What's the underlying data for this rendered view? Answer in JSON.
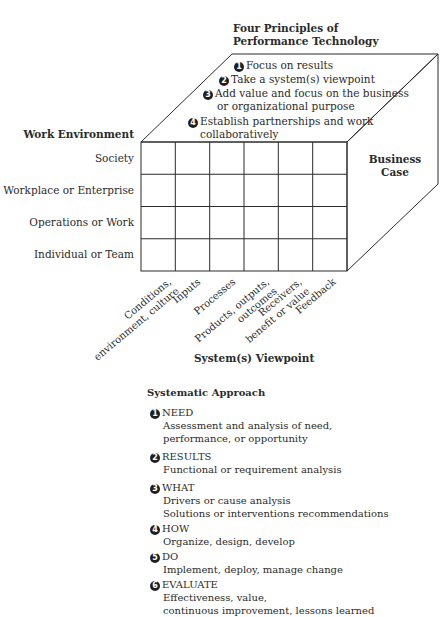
{
  "principles": {
    "title_line1": "Four Principles of",
    "title_line2": "Performance Technology",
    "items": [
      {
        "num": "1",
        "text": "Focus on results"
      },
      {
        "num": "2",
        "text": "Take a system(s) viewpoint"
      },
      {
        "num": "3",
        "text": "Add value and focus on the business",
        "text2": "or organizational purpose"
      },
      {
        "num": "4",
        "text": "Establish partnerships and work",
        "text2": "collaboratively"
      }
    ]
  },
  "work_environment": {
    "title": "Work Environment",
    "rows": [
      "Society",
      "Workplace or Enterprise",
      "Operations or Work",
      "Individual or Team"
    ]
  },
  "business_case": {
    "line1": "Business",
    "line2": "Case"
  },
  "system_viewpoint": {
    "title": "System(s) Viewpoint",
    "columns": [
      {
        "line1": "Conditions,",
        "line2": "environment, culture"
      },
      {
        "line1": "Inputs",
        "line2": ""
      },
      {
        "line1": "Processes",
        "line2": ""
      },
      {
        "line1": "Products, outputs,",
        "line2": "outcomes"
      },
      {
        "line1": "Receivers,",
        "line2": "benefit or value"
      },
      {
        "line1": "Feedback",
        "line2": ""
      }
    ]
  },
  "systematic_approach": {
    "title": "Systematic Approach",
    "steps": [
      {
        "num": "1",
        "name": "NEED",
        "desc": [
          "Assessment and analysis of need,",
          "performance, or opportunity"
        ]
      },
      {
        "num": "2",
        "name": "RESULTS",
        "desc": [
          "Functional or requirement analysis"
        ]
      },
      {
        "num": "3",
        "name": "WHAT",
        "desc": [
          "Drivers or cause analysis",
          "Solutions or interventions recommendations"
        ]
      },
      {
        "num": "4",
        "name": "HOW",
        "desc": [
          "Organize, design, develop"
        ]
      },
      {
        "num": "5",
        "name": "DO",
        "desc": [
          "Implement, deploy, manage change"
        ]
      },
      {
        "num": "6",
        "name": "EVALUATE",
        "desc": [
          "Effectiveness, value,",
          "continuous improvement, lessons learned"
        ]
      }
    ]
  },
  "colors": {
    "line": "#2b2b2b",
    "text": "#2b2b2b",
    "background": "#ffffff"
  }
}
